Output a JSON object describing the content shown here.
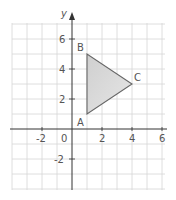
{
  "diagram": {
    "type": "coordinate-plane",
    "axes": {
      "x_label": "",
      "y_label": "y",
      "x_ticks": [
        {
          "value": -2,
          "label": "-2"
        },
        {
          "value": 2,
          "label": "2"
        },
        {
          "value": 4,
          "label": "4"
        },
        {
          "value": 6,
          "label": "6"
        }
      ],
      "y_ticks": [
        {
          "value": 6,
          "label": "6"
        },
        {
          "value": 4,
          "label": "4"
        },
        {
          "value": 2,
          "label": "2"
        },
        {
          "value": -2,
          "label": "-2"
        }
      ],
      "origin_label": "0",
      "x_range": [
        -4,
        6
      ],
      "y_range": [
        -4,
        7
      ]
    },
    "triangle": {
      "fill": "#d9d9d9",
      "stroke": "#666666",
      "vertices": [
        {
          "name": "A",
          "x": 1,
          "y": 1
        },
        {
          "name": "B",
          "x": 1,
          "y": 5
        },
        {
          "name": "C",
          "x": 4,
          "y": 3
        }
      ]
    },
    "colors": {
      "grid": "#d0d0d0",
      "axis": "#333333"
    }
  }
}
